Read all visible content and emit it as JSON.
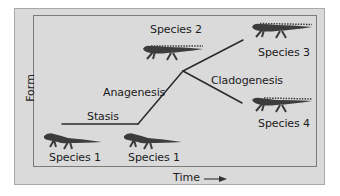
{
  "diagram": {
    "axes": {
      "y_label": "Form",
      "x_label": "Time",
      "x_arrow_icon": "right-arrow-icon"
    },
    "process_labels": {
      "stasis": "Stasis",
      "anagenesis": "Anagenesis",
      "cladogenesis": "Cladogenesis"
    },
    "species": [
      {
        "label": "Species 1",
        "position": "bottom-left"
      },
      {
        "label": "Species 1",
        "position": "bottom-middle"
      },
      {
        "label": "Species 2",
        "position": "top-middle"
      },
      {
        "label": "Species 3",
        "position": "top-right"
      },
      {
        "label": "Species 4",
        "position": "middle-right"
      }
    ],
    "colors": {
      "background": "#dadada",
      "line": "#2a2a2a",
      "salamander": "#3c3c3c",
      "frame": "#7a7a7a"
    }
  }
}
